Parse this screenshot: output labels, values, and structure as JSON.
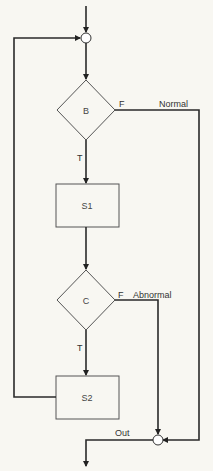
{
  "diagram": {
    "type": "flowchart",
    "background": "#f8f7f2",
    "nodes": {
      "entry_junction": {
        "kind": "junction"
      },
      "B": {
        "kind": "decision",
        "label": "B"
      },
      "S1": {
        "kind": "process",
        "label": "S1"
      },
      "C": {
        "kind": "decision",
        "label": "C"
      },
      "S2": {
        "kind": "process",
        "label": "S2"
      },
      "exit_junction": {
        "kind": "junction"
      }
    },
    "edge_labels": {
      "b_true": "T",
      "b_false": "F",
      "b_false_path": "Normal",
      "c_true": "T",
      "c_false": "F",
      "c_false_path": "Abnormal",
      "exit": "Out"
    },
    "edges": [
      {
        "from": "start",
        "to": "entry_junction"
      },
      {
        "from": "entry_junction",
        "to": "B"
      },
      {
        "from": "B",
        "to": "S1",
        "label": "T"
      },
      {
        "from": "B",
        "to": "exit_junction",
        "label": "F / Normal"
      },
      {
        "from": "S1",
        "to": "C"
      },
      {
        "from": "C",
        "to": "S2",
        "label": "T"
      },
      {
        "from": "C",
        "to": "exit_junction",
        "label": "F / Abnormal"
      },
      {
        "from": "S2",
        "to": "entry_junction",
        "label": "loop back"
      },
      {
        "from": "exit_junction",
        "to": "end",
        "label": "Out"
      }
    ]
  }
}
